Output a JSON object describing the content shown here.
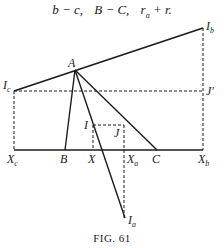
{
  "header": {
    "expressions": [
      "b − c,",
      "B − C,",
      "r",
      "a",
      " + r."
    ]
  },
  "caption": "FIG. 61",
  "labels": {
    "A": "A",
    "Ib": "I",
    "Ib_sub": "b",
    "Ic": "I",
    "Ic_sub": "c",
    "Jprime": "J′",
    "I": "I",
    "J": "J",
    "Xc": "X",
    "Xc_sub": "c",
    "B": "B",
    "X": "X",
    "Xa": "X",
    "Xa_sub": "a",
    "C": "C",
    "Xb": "X",
    "Xb_sub": "b",
    "Ia": "I",
    "Ia_sub": "a"
  }
}
